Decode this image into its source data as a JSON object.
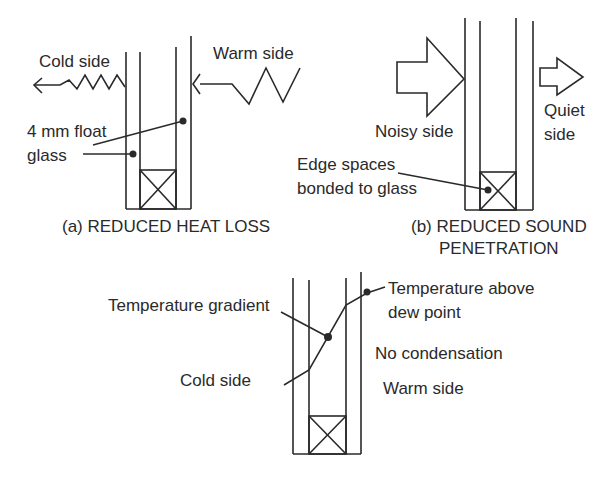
{
  "diagram_a": {
    "caption": "(a) REDUCED HEAT LOSS",
    "cold_side": "Cold side",
    "warm_side": "Warm side",
    "glass_label_line1": "4 mm float",
    "glass_label_line2": "glass"
  },
  "diagram_b": {
    "caption_line1": "(b) REDUCED SOUND",
    "caption_line2": "PENETRATION",
    "noisy_side": "Noisy side",
    "quiet_side_line1": "Quiet",
    "quiet_side_line2": "side",
    "edge_label_line1": "Edge spaces",
    "edge_label_line2": "bonded to glass"
  },
  "diagram_c": {
    "gradient_label": "Temperature gradient",
    "dew_label_line1": "Temperature above",
    "dew_label_line2": "dew point",
    "no_condensation": "No condensation",
    "cold_side": "Cold side",
    "warm_side": "Warm side"
  }
}
